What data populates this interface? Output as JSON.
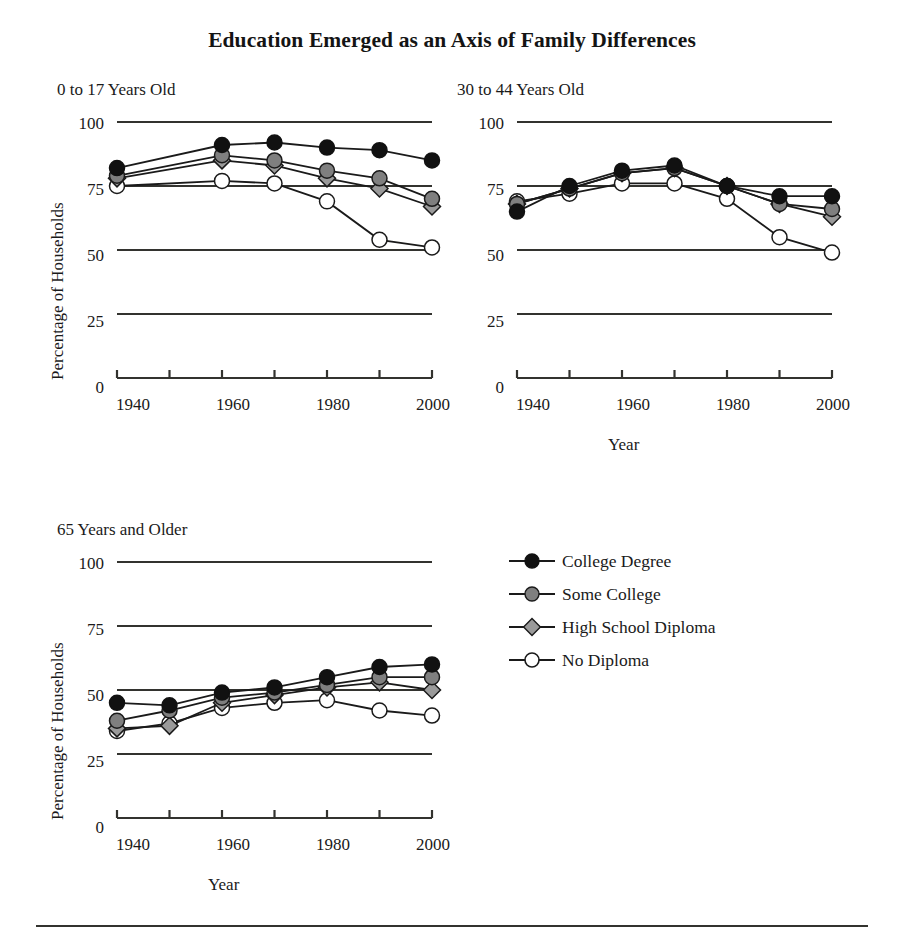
{
  "figure": {
    "title": "Education Emerged as an Axis of Family Differences",
    "y_axis_label": "Percentage of Households",
    "x_axis_label": "Year"
  },
  "legend": {
    "position": "right-middle",
    "items": [
      {
        "label": "College Degree",
        "marker": "filled-circle",
        "color": "#111111",
        "name": "legend-item-college-degree"
      },
      {
        "label": "Some College",
        "marker": "gray-circle",
        "color": "#7f7f7f",
        "name": "legend-item-some-college"
      },
      {
        "label": "High School Diploma",
        "marker": "gray-diamond",
        "color": "#9a9a9a",
        "name": "legend-item-high-school-diploma"
      },
      {
        "label": "No Diploma",
        "marker": "open-circle",
        "color": "#ffffff",
        "name": "legend-item-no-diploma"
      }
    ]
  },
  "axes": {
    "y_ticks": [
      0,
      25,
      50,
      75,
      100
    ],
    "y_tick_labels": [
      "0",
      "25",
      "50",
      "75",
      "100"
    ],
    "ylim": [
      0,
      100
    ],
    "x_ticks": [
      1940,
      1950,
      1960,
      1970,
      1980,
      1990,
      2000
    ],
    "x_tick_labels_shown": [
      "1940",
      "1960",
      "1980",
      "2000"
    ],
    "xlim": [
      1940,
      2000
    ],
    "grid": "horizontal-only"
  },
  "chart_data": [
    {
      "type": "line",
      "title": "0 to 17 Years Old",
      "xlabel": "",
      "ylabel": "Percentage of Households",
      "ylim": [
        0,
        100
      ],
      "xlim": [
        1940,
        2000
      ],
      "x": [
        1940,
        1960,
        1970,
        1980,
        1990,
        2000
      ],
      "series": [
        {
          "name": "College Degree",
          "values": [
            82,
            91,
            92,
            90,
            89,
            85
          ]
        },
        {
          "name": "Some College",
          "values": [
            79,
            87,
            85,
            81,
            78,
            70
          ]
        },
        {
          "name": "High School Diploma",
          "values": [
            78,
            85,
            83,
            78,
            74,
            67
          ]
        },
        {
          "name": "No Diploma",
          "values": [
            75,
            77,
            76,
            69,
            54,
            51
          ]
        }
      ]
    },
    {
      "type": "line",
      "title": "30 to 44 Years Old",
      "xlabel": "Year",
      "ylabel": "",
      "ylim": [
        0,
        100
      ],
      "xlim": [
        1940,
        2000
      ],
      "x": [
        1940,
        1950,
        1960,
        1970,
        1980,
        1990,
        2000
      ],
      "series": [
        {
          "name": "College Degree",
          "values": [
            65,
            75,
            81,
            83,
            75,
            71,
            71
          ]
        },
        {
          "name": "Some College",
          "values": [
            68,
            74,
            80,
            82,
            75,
            68,
            66
          ]
        },
        {
          "name": "High School Diploma",
          "values": [
            68,
            74,
            80,
            82,
            75,
            68,
            63
          ]
        },
        {
          "name": "No Diploma",
          "values": [
            69,
            72,
            76,
            76,
            70,
            55,
            49
          ]
        }
      ]
    },
    {
      "type": "line",
      "title": "65 Years and Older",
      "xlabel": "Year",
      "ylabel": "Percentage of Households",
      "ylim": [
        0,
        100
      ],
      "xlim": [
        1940,
        2000
      ],
      "x": [
        1940,
        1950,
        1960,
        1970,
        1980,
        1990,
        2000
      ],
      "series": [
        {
          "name": "College Degree",
          "values": [
            45,
            44,
            49,
            51,
            55,
            59,
            60
          ]
        },
        {
          "name": "Some College",
          "values": [
            38,
            42,
            47,
            49,
            52,
            55,
            55
          ]
        },
        {
          "name": "High School Diploma",
          "values": [
            35,
            36,
            45,
            48,
            51,
            53,
            50
          ]
        },
        {
          "name": "No Diploma",
          "values": [
            34,
            37,
            43,
            45,
            46,
            42,
            40
          ]
        }
      ]
    }
  ]
}
